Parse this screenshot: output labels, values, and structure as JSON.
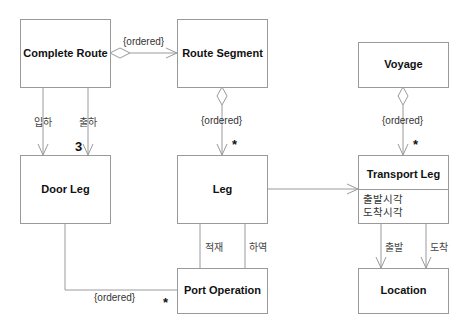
{
  "classes": {
    "complete_route": {
      "name": "Complete Route"
    },
    "route_segment": {
      "name": "Route Segment"
    },
    "voyage": {
      "name": "Voyage"
    },
    "door_leg": {
      "name": "Door Leg"
    },
    "leg": {
      "name": "Leg"
    },
    "transport_leg": {
      "name": "Transport Leg",
      "attributes": [
        "출발시각",
        "도착시각"
      ]
    },
    "port_operation": {
      "name": "Port Operation"
    },
    "location": {
      "name": "Location"
    }
  },
  "associations": {
    "complete_route_to_route_segment": {
      "constraint": "{ordered}",
      "type": "aggregation"
    },
    "route_segment_to_leg": {
      "constraint": "{ordered}",
      "multiplicity": "*",
      "type": "aggregation"
    },
    "voyage_to_transport_leg": {
      "constraint": "{ordered}",
      "multiplicity": "*",
      "type": "aggregation"
    },
    "complete_route_to_door_leg": {
      "roles": [
        "입하",
        "출하"
      ],
      "multiplicity": "3"
    },
    "leg_to_port_operation": {
      "roles": [
        "적재",
        "하역"
      ]
    },
    "door_leg_to_port_operation": {
      "constraint": "{ordered}",
      "multiplicity": "*"
    },
    "transport_leg_to_location": {
      "roles": [
        "출발",
        "도착"
      ]
    }
  },
  "colors": {
    "line": "#9a9a9a",
    "text": "#111111"
  }
}
